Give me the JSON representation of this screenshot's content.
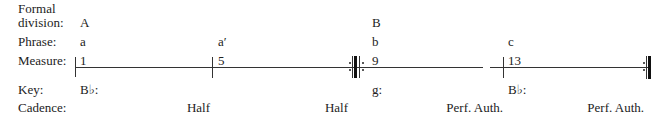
{
  "labels": {
    "formal_line1": "Formal",
    "formal_line2": "division:",
    "phrase": "Phrase:",
    "measure": "Measure:",
    "key": "Key:",
    "cadence": "Cadence:"
  },
  "formal_division": [
    "A",
    "B"
  ],
  "phrases": [
    "a",
    "a′",
    "b",
    "c"
  ],
  "measures": [
    "1",
    "5",
    "9",
    "13"
  ],
  "keys": [
    "B♭:",
    "g:",
    "B♭:"
  ],
  "cadences": [
    "Half",
    "Half",
    "Perf. Auth.",
    "Perf. Auth."
  ]
}
